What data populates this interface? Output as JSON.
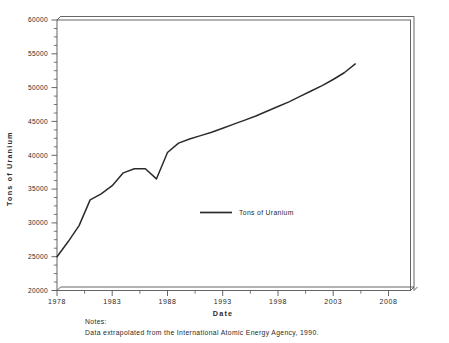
{
  "chart_data": {
    "type": "line",
    "title": "",
    "xlabel": "Date",
    "ylabel": "Tons of Uranium",
    "xlim": [
      1978,
      2010
    ],
    "ylim": [
      20000,
      60000
    ],
    "grid": false,
    "legend_position": "center",
    "series": [
      {
        "name": "Tons of Uranium",
        "color": "#2b2b2b",
        "x": [
          1978,
          1979,
          1980,
          1981,
          1982,
          1983,
          1984,
          1985,
          1986,
          1987,
          1988,
          1989,
          1990,
          1991,
          1992,
          1993,
          1994,
          1995,
          1996,
          1997,
          1998,
          1999,
          2000,
          2001,
          2002,
          2003,
          2004,
          2005
        ],
        "values": [
          25000,
          27200,
          29600,
          33400,
          34300,
          35500,
          37400,
          38000,
          38000,
          36500,
          40400,
          41800,
          42400,
          42900,
          43400,
          44000,
          44600,
          45200,
          45800,
          46500,
          47200,
          47900,
          48700,
          49500,
          50300,
          51200,
          52200,
          53500
        ]
      }
    ],
    "x_ticks": [
      1978,
      1983,
      1988,
      1993,
      1998,
      2003,
      2008
    ],
    "x_tick_labels": [
      "1978",
      "1983",
      "1988",
      "1993",
      "1998",
      "2003",
      "2008"
    ],
    "y_ticks": [
      20000,
      25000,
      30000,
      35000,
      40000,
      45000,
      50000,
      55000,
      60000
    ],
    "y_tick_labels": [
      "20000",
      "25000",
      "30000",
      "35000",
      "40000",
      "45000",
      "50000",
      "55000",
      "60000"
    ],
    "x_minor_tick_step": 1,
    "y_minor_tick_step": 1250
  },
  "legend": {
    "entries": [
      {
        "label": "Tons of Uranium"
      }
    ]
  },
  "axes": {
    "x_title": "Date",
    "y_title": "Tons of Uranium"
  },
  "notes": {
    "heading": "Notes:",
    "body": "Data extrapolated from the International Atomic Energy Agency, 1990."
  },
  "colors": {
    "line": "#2b2b2b",
    "frame": "#555555",
    "background": "#ffffff",
    "text": "#2a2a2a"
  }
}
